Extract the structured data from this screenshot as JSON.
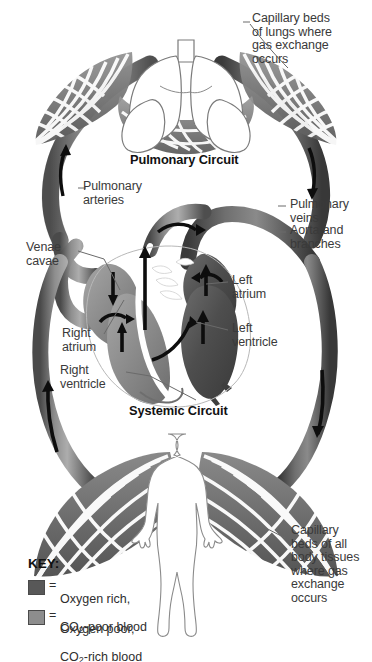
{
  "diagram": {
    "type": "anatomical-schematic",
    "background_color": "#ffffff"
  },
  "headings": {
    "pulmonary_circuit": "Pulmonary Circuit",
    "systemic_circuit": "Systemic Circuit"
  },
  "labels": {
    "capillary_lungs": "Capillary beds\nof lungs where\ngas exchange\noccurs",
    "pulmonary_arteries": "Pulmonary\narteries",
    "pulmonary_veins": "Pulmonary\nveins",
    "aorta_branches": "Aorta and\nbranches",
    "venae_cavae": "Venae\ncavae",
    "left_atrium": "Left\natrium",
    "left_ventricle": "Left\nventricle",
    "right_atrium": "Right\natrium",
    "right_ventricle": "Right\nventricle",
    "capillary_body": "Capillary\nbeds of all\nbody tissues\nwhere gas\nexchange\noccurs"
  },
  "key": {
    "title": "KEY:",
    "equals": "=",
    "entries": [
      {
        "swatch_color": "#585858",
        "line1": "Oxygen rich,",
        "line2_pre": "CO",
        "line2_sub": "2",
        "line2_post": "-poor blood"
      },
      {
        "swatch_color": "#8d8d8d",
        "line1": "Oxygen poor,",
        "line2_pre": "CO",
        "line2_sub": "2",
        "line2_post": "-rich blood"
      }
    ]
  },
  "colors": {
    "oxygen_rich": "#585858",
    "oxygen_poor": "#8d8d8d",
    "vessel_dark": "#4f4f4f",
    "vessel_mid": "#808080",
    "vessel_light": "#a8a8a8",
    "arrow": "#0d0d0d",
    "outline": "#6b6b6b",
    "text": "#3a3a3a",
    "heading_text": "#111111"
  }
}
